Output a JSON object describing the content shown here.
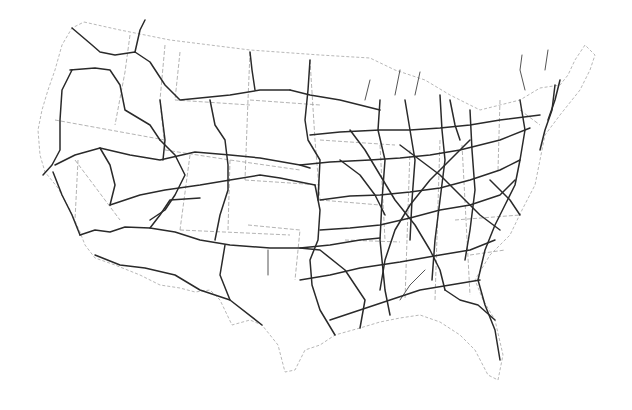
{
  "map": {
    "subject": "Contiguous United States interstate highway network",
    "colors": {
      "background": "#ffffff",
      "highway": "#2a2a2a",
      "minor_highway": "#555555",
      "state_line": "#a0a0a0",
      "coast_border": "#b8b8b8"
    },
    "outline": "M84,22 L120,30 L170,40 L250,50 L320,55 L370,58 L395,70 L425,80 L450,95 L480,110 L520,100 L540,88 L560,85 L568,75 L575,60 L585,45 L595,55 L590,70 L580,90 L560,115 L545,135 L540,160 L535,185 L522,210 L510,235 L490,255 L475,280 L483,300 L495,320 L503,355 L498,380 L488,375 L475,350 L460,335 L440,322 L420,315 L400,318 L380,322 L360,328 L335,335 L320,345 L305,350 L295,370 L285,372 L278,345 L262,325 L250,320 L232,325 L220,300 L210,290 L195,292 L180,288 L160,285 L140,275 L115,265 L95,258 L85,245 L80,232 L70,210 L58,188 L45,172 L40,155 L38,130 L42,110 L48,90 L55,70 L62,45 L72,28 Z",
    "state_lines": [
      "M130,35 L125,72 L115,125",
      "M55,120 L165,140",
      "M78,160 L75,220",
      "M75,160 L120,220",
      "M165,45 L160,100 L165,150",
      "M165,150 L230,160 L300,170",
      "M180,52 L175,100 L250,105",
      "M250,52 L248,100 L245,180",
      "M250,100 L320,105",
      "M245,180 L320,185",
      "M190,155 L180,230",
      "M230,160 L228,230",
      "M180,230 L290,235",
      "M248,225 L300,230 L295,280",
      "M310,60 L315,140 L320,200",
      "M320,140 L395,145",
      "M380,145 L385,240",
      "M320,200 L380,205",
      "M345,240 L400,242",
      "M410,150 L405,300",
      "M440,140 L435,300",
      "M462,145 L470,295",
      "M455,220 L520,215",
      "M470,255 L505,250",
      "M500,100 L498,170",
      "M520,110 L540,125"
    ],
    "highways": [
      "M72,28 L92,45 L100,52 L115,55 L135,52 L150,62 L165,85 L180,100 L230,95 L260,90 L290,90",
      "M70,70 L95,68 L110,70 L120,85 L125,110 L150,125 L160,140",
      "M55,165 L75,155 L100,148 L130,155 L160,160 L195,152 L230,155 L260,158 L300,165 L310,168",
      "M43,175 L52,165 L60,150 L60,120 L62,90 L72,70",
      "M53,172 L62,195 L72,215 L80,235",
      "M80,235 L95,230 L110,232 L125,227 L150,228 L175,232 L200,240 L230,245 L270,248 L300,248 L330,245 L360,240 L380,238",
      "M95,255 L120,265 L145,268 L175,275 L200,290 L230,300 L262,325",
      "M160,140 L175,155 L185,175 L175,195 L165,210 L150,220",
      "M160,100 L165,140 L163,160",
      "M210,100 L215,125 L225,140 L228,165 L228,190 L220,215 L215,240",
      "M110,205 L140,195 L165,190 L200,185 L230,180 L260,175 L280,178 L315,185",
      "M150,228 L160,215 L170,200 L200,198",
      "M225,245 L220,275 L230,300",
      "M300,248 L320,250 L345,270 L365,300 L360,328",
      "M315,185 L320,210 L318,240 L310,260 L312,285 L320,310 L335,335",
      "M310,60 L308,90 L305,120 L308,140 L320,160 L318,200",
      "M290,90 L310,95 L340,100 L360,105 L380,110",
      "M310,135 L340,132 L380,130 L410,130 L440,128 L470,125 L500,120 L540,115",
      "M300,165 L330,162 L370,160 L400,158 L430,155 L460,150 L500,140 L530,128",
      "M320,200 L350,196 L380,195 L410,192 L440,188 L470,180 L500,170 L520,160",
      "M320,230 L350,228 L380,225 L410,218 L440,210 L470,205 L500,195 L515,180",
      "M300,280 L330,275 L360,268 L400,262 L440,255 L470,250 L495,240",
      "M330,320 L360,310 L390,300 L420,290 L450,285 L480,280",
      "M380,100 L378,130 L385,160 L382,200 L380,240 L385,290 L390,315",
      "M405,100 L410,130 L415,160 L412,200 L410,240",
      "M440,95 L442,130 L445,160 L440,200 L435,240 L432,280",
      "M470,110 L472,150 L475,190 L470,230 L465,260",
      "M520,100 L525,130 L520,160 L515,185 L505,205 L495,225 L485,250 L478,280 L485,305 L495,330 L500,360",
      "M555,85 L552,110 L545,130 L540,150",
      "M560,80 L555,100 L548,120",
      "M350,130 L365,150 L380,175 L395,200 L415,225 L430,250 L440,270 L445,290",
      "M470,140 L450,160 L430,180 L410,205 L395,230 L385,260 L380,290",
      "M340,160 L360,175 L375,195 L385,215",
      "M400,145 L420,160 L440,175 L460,195 L480,215 L500,230",
      "M445,290 L460,300 L478,305 L495,320",
      "M490,180 L510,200 L520,215",
      "M100,148 L110,165 L115,185 L110,205",
      "M135,52 L140,30 L145,20",
      "M250,52 L252,70 L255,90",
      "M450,100 L455,125 L460,140"
    ],
    "minor_highways": [
      "M365,100 L370,80",
      "M395,95 L400,70",
      "M415,95 L420,72",
      "M525,90 L520,70 L522,55",
      "M545,70 L548,50",
      "M268,250 L268,275",
      "M400,300 L410,285 L425,270"
    ]
  }
}
